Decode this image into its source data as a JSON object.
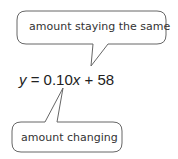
{
  "top_callout": {
    "text": "amount staying the same"
  },
  "equation": {
    "lhs": "y",
    "equals": " = 0.10",
    "var": "x",
    "rest": " + 58"
  },
  "bottom_callout": {
    "text": "amount changing"
  },
  "colors": {
    "stroke": "#555555",
    "text": "#333333"
  }
}
